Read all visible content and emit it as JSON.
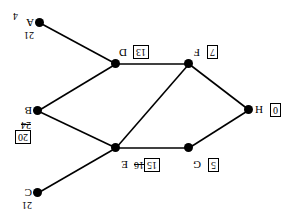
{
  "diagram": {
    "type": "node-link-graph",
    "orientation_note": "rendered rotated 180 degrees",
    "stroke_color": "#000000",
    "node_color": "#000000",
    "background": "#ffffff"
  },
  "nodes": [
    {
      "id": "C",
      "label": "C",
      "x": 250,
      "y": 22,
      "dist_final": "21",
      "dist_boxed": false,
      "dist_struck": null,
      "label_dx": 6,
      "label_dy": -5,
      "dist_dx": 6,
      "dist_dy": -17
    },
    {
      "id": "G",
      "label": "G",
      "x": 99,
      "y": 67,
      "dist_final": "5",
      "dist_boxed": true,
      "dist_struck": null,
      "label_dx": -12,
      "label_dy": -22,
      "dist_dx": -30,
      "dist_dy": -24
    },
    {
      "id": "E",
      "label": "E",
      "x": 172,
      "y": 67,
      "dist_final": "15",
      "dist_boxed": true,
      "dist_struck": "16",
      "label_dx": -12,
      "label_dy": -22,
      "dist_dx": -44,
      "dist_dy": -24,
      "struck_dx": -28,
      "struck_dy": -22
    },
    {
      "id": "H",
      "label": "H",
      "x": 39,
      "y": 105,
      "dist_final": "0",
      "dist_boxed": true,
      "dist_struck": null,
      "label_dx": -14,
      "label_dy": -5,
      "dist_dx": -32,
      "dist_dy": -7
    },
    {
      "id": "B",
      "label": "B",
      "x": 250,
      "y": 104,
      "dist_final": "20",
      "dist_boxed": true,
      "dist_struck": "24",
      "label_dx": 6,
      "label_dy": -5,
      "dist_dx": 7,
      "dist_dy": -33,
      "struck_dx": 7,
      "struck_dy": -19
    },
    {
      "id": "F",
      "label": "F",
      "x": 99,
      "y": 151,
      "dist_final": "7",
      "dist_boxed": true,
      "dist_struck": null,
      "label_dx": -11,
      "label_dy": 6,
      "dist_dx": -29,
      "dist_dy": 5
    },
    {
      "id": "D",
      "label": "D",
      "x": 172,
      "y": 151,
      "dist_final": "13",
      "dist_boxed": true,
      "dist_struck": null,
      "label_dx": -11,
      "label_dy": 6,
      "dist_dx": -33,
      "dist_dy": 5
    },
    {
      "id": "A",
      "label": "A",
      "x": 248,
      "y": 192,
      "dist_final": "21",
      "dist_boxed": false,
      "dist_struck": null,
      "label_dx": 6,
      "label_dy": -5,
      "dist_dx": 6,
      "dist_dy": -17
    }
  ],
  "edges": [
    {
      "from": "H",
      "to": "G"
    },
    {
      "from": "H",
      "to": "F"
    },
    {
      "from": "G",
      "to": "E"
    },
    {
      "from": "E",
      "to": "C"
    },
    {
      "from": "E",
      "to": "B"
    },
    {
      "from": "E",
      "to": "F"
    },
    {
      "from": "F",
      "to": "D"
    },
    {
      "from": "D",
      "to": "B"
    },
    {
      "from": "D",
      "to": "A"
    }
  ],
  "stray_labels": [
    {
      "text": "4",
      "x": 270,
      "y": 194
    }
  ]
}
